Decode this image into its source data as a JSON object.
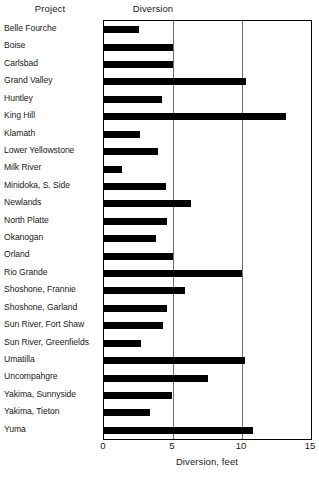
{
  "header": {
    "project_label": "Project",
    "diversion_label": "Diversion"
  },
  "axis": {
    "xlabel": "Diversion, feet",
    "ticks": [
      "0",
      "5",
      "10",
      "15"
    ]
  },
  "chart_data": {
    "type": "bar",
    "orientation": "horizontal",
    "title": "Diversion",
    "xlabel": "Diversion, feet",
    "ylabel": "Project",
    "xlim": [
      0,
      15
    ],
    "xticks": [
      0,
      5,
      10,
      15
    ],
    "grid": true,
    "legend": "none",
    "bar_color": "#000000",
    "categories": [
      "Belle Fourche",
      "Boise",
      "Carlsbad",
      "Grand Valley",
      "Huntley",
      "King Hill",
      "Klamath",
      "Lower Yellowstone",
      "Milk River",
      "Minidoka, S. Side",
      "Newlands",
      "North Platte",
      "Okanogan",
      "Orland",
      "Rio Grande",
      "Shoshone, Frannie",
      "Shoshone, Garland",
      "Sun River, Fort Shaw",
      "Sun River, Greenfields",
      "Umatilla",
      "Uncompahgre",
      "Yakima, Sunnyside",
      "Yakima, Tieton",
      "Yuma"
    ],
    "values": [
      2.5,
      5.0,
      5.0,
      10.3,
      4.2,
      13.2,
      2.6,
      3.9,
      1.3,
      4.5,
      6.3,
      4.6,
      3.8,
      5.0,
      10.0,
      5.9,
      4.6,
      4.3,
      2.7,
      10.2,
      7.5,
      4.9,
      3.3,
      10.8
    ]
  }
}
